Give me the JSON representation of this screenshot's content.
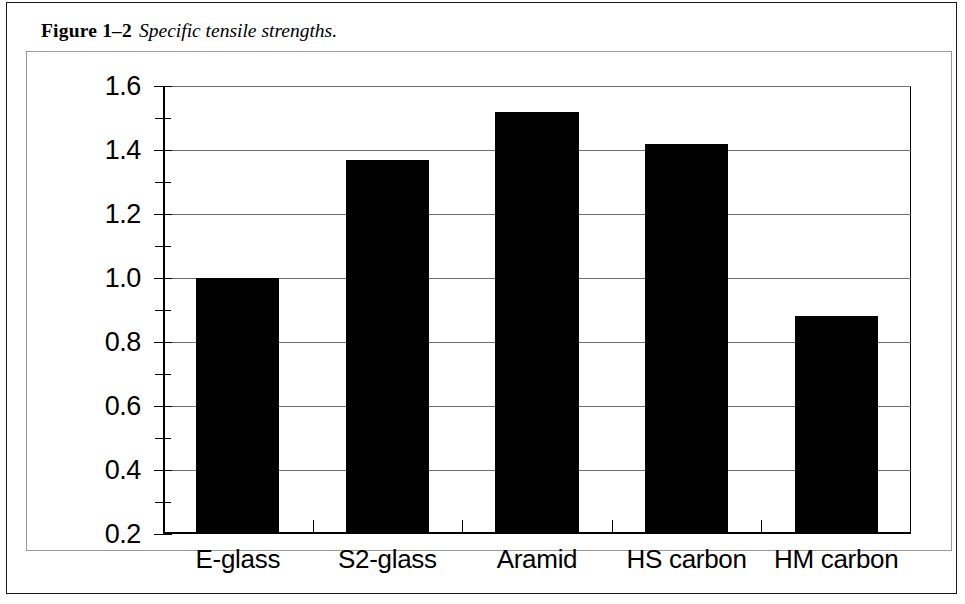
{
  "figure": {
    "number": "Figure 1–2",
    "title": "Specific tensile strengths."
  },
  "chart_data": {
    "type": "bar",
    "title": "",
    "xlabel": "",
    "ylabel": "Specific tensile strength, E-glass = 1",
    "categories": [
      "E-glass",
      "S2-glass",
      "Aramid",
      "HS carbon",
      "HM carbon"
    ],
    "values": [
      1.0,
      1.37,
      1.52,
      1.42,
      0.88
    ],
    "series": [
      {
        "name": "Specific tensile strength",
        "values": [
          1.0,
          1.37,
          1.52,
          1.42,
          0.88
        ]
      }
    ],
    "ylim": [
      0.2,
      1.6
    ],
    "ytick_labels": [
      "1.6",
      "1.4",
      "1.2",
      "1.0",
      "0.8",
      "0.6",
      "0.4",
      "0.2"
    ],
    "ytick_values": [
      1.6,
      1.4,
      1.2,
      1.0,
      0.8,
      0.6,
      0.4,
      0.2
    ],
    "yminor_values": [
      1.5,
      1.3,
      1.1,
      0.9,
      0.7,
      0.5,
      0.3
    ],
    "grid": true,
    "grid_axis": "y",
    "legend": false,
    "bar_color": "#000000",
    "grid_color": "#6f6f6f",
    "axis_color": "#000000"
  }
}
